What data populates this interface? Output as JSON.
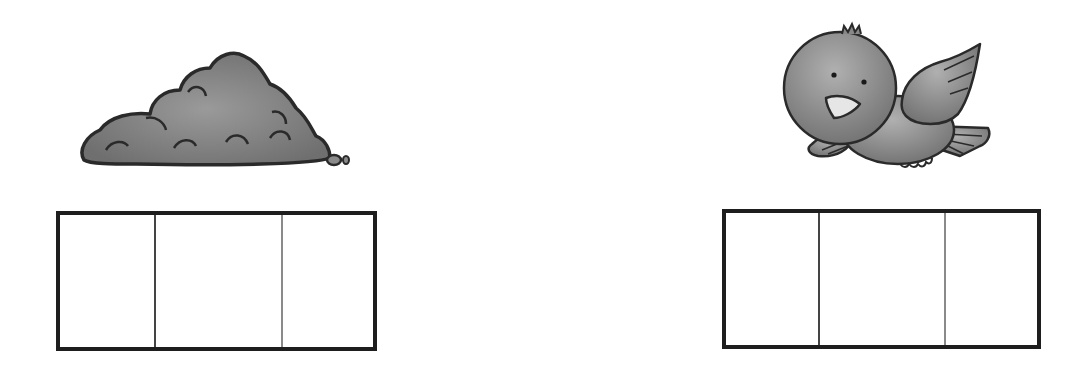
{
  "worksheet": {
    "items": [
      {
        "word": "dirt",
        "picture": "dirt-pile-icon",
        "sound_boxes": 3,
        "boxes": [
          "",
          "",
          ""
        ]
      },
      {
        "word": "bird",
        "picture": "bird-icon",
        "sound_boxes": 3,
        "boxes": [
          "",
          "",
          ""
        ]
      }
    ],
    "colors": {
      "outline": "#1e1e1e",
      "fill": "#808080",
      "background": "#ffffff"
    }
  }
}
